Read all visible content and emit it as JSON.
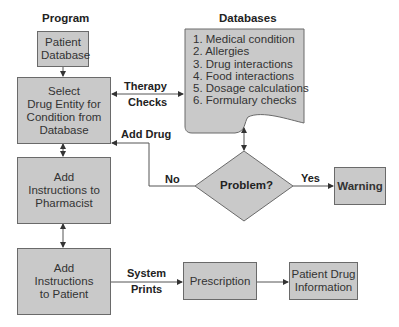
{
  "titles": {
    "program": "Program",
    "databases": "Databases"
  },
  "nodes": {
    "patient_database": "Patient Database",
    "select_drug": [
      "Select",
      "Drug Entity for",
      "Condition from",
      "Database"
    ],
    "pharmacist": [
      "Add",
      "Instructions to",
      "Pharmacist"
    ],
    "patient": [
      "Add",
      "Instructions",
      "to Patient"
    ],
    "decision": "Problem?",
    "warning": "Warning",
    "prescription": "Prescription",
    "patient_drug_info": [
      "Patient Drug",
      "Information"
    ]
  },
  "databases": {
    "items": [
      "1. Medical condition",
      "2. Allergies",
      "3. Drug interactions",
      "4. Food interactions",
      "5. Dosage calculations",
      "6. Formulary checks"
    ]
  },
  "edge_labels": {
    "therapy": "Therapy",
    "checks": "Checks",
    "add_drug": "Add Drug",
    "no": "No",
    "yes": "Yes",
    "system": "System",
    "prints": "Prints"
  },
  "colors": {
    "fill": "#c9c9c9",
    "stroke": "#6a6a6a",
    "line": "#555555"
  }
}
